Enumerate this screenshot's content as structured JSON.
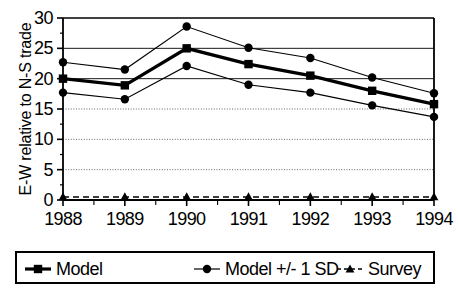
{
  "chart_data": {
    "type": "line",
    "title": "",
    "xlabel": "",
    "ylabel": "E-W relative to N-S trade",
    "categories": [
      "1988",
      "1989",
      "1990",
      "1991",
      "1992",
      "1993",
      "1994"
    ],
    "x": [
      1988,
      1989,
      1990,
      1991,
      1992,
      1993,
      1994
    ],
    "ylim": [
      0,
      30
    ],
    "yticks": [
      0,
      5,
      10,
      15,
      20,
      25,
      30
    ],
    "ytick_labels": [
      "0",
      "5",
      "10",
      "15",
      "20",
      "25",
      "30"
    ],
    "grid": true,
    "grid_axis": "y",
    "legend_position": "below",
    "series": [
      {
        "name": "Model",
        "marker": "square",
        "line": "solid-thick",
        "color": "#000000",
        "values": [
          20.0,
          18.9,
          25.0,
          22.4,
          20.5,
          18.0,
          15.8
        ]
      },
      {
        "name": "Model +/- 1 SD",
        "marker": "circle",
        "line": "solid-thin",
        "color": "#000000",
        "band": "upper",
        "values": [
          22.7,
          21.5,
          28.6,
          25.1,
          23.4,
          20.2,
          17.6
        ]
      },
      {
        "name": "Model +/- 1 SD",
        "marker": "circle",
        "line": "solid-thin",
        "color": "#000000",
        "band": "lower",
        "values": [
          17.7,
          16.6,
          22.1,
          19.0,
          17.7,
          15.6,
          13.7
        ]
      },
      {
        "name": "Survey",
        "marker": "triangle",
        "line": "dashed",
        "color": "#000000",
        "values": [
          0.5,
          0.5,
          0.5,
          0.5,
          0.5,
          0.5,
          0.5
        ]
      }
    ]
  },
  "axes": {
    "y_title": "E-W relative to N-S trade",
    "y_tick_labels": [
      "30",
      "25",
      "20",
      "15",
      "10",
      "5",
      "0"
    ],
    "x_tick_labels": [
      "1988",
      "1989",
      "1990",
      "1991",
      "1992",
      "1993",
      "1994"
    ]
  },
  "legend": {
    "items": [
      {
        "label": "Model",
        "marker": "square"
      },
      {
        "label": "Model +/- 1 SD",
        "marker": "circle"
      },
      {
        "label": "Survey",
        "marker": "triangle"
      }
    ]
  }
}
